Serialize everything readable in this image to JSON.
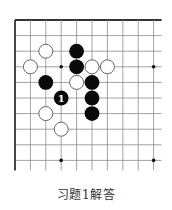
{
  "diagram": {
    "type": "go-board-diagram",
    "caption": "习题1解答",
    "grid": {
      "columns": 10,
      "rows": 10,
      "origin_x": 15,
      "origin_y": 20,
      "col_spacing": 15.4,
      "row_spacing": 15.6,
      "extend_right": 8,
      "extend_bottom": 10,
      "line_color": "#8a8a8a",
      "edge_color": "#333333"
    },
    "star_points": [
      {
        "col": 3,
        "row": 3
      },
      {
        "col": 9,
        "row": 3
      },
      {
        "col": 3,
        "row": 9
      },
      {
        "col": 9,
        "row": 9
      }
    ],
    "stones": [
      {
        "color": "black",
        "col": 4,
        "row": 2
      },
      {
        "color": "black",
        "col": 4,
        "row": 3
      },
      {
        "color": "black",
        "col": 2,
        "row": 4
      },
      {
        "color": "black",
        "col": 5,
        "row": 4
      },
      {
        "color": "black",
        "col": 3,
        "row": 5,
        "label": "1"
      },
      {
        "color": "black",
        "col": 5,
        "row": 5
      },
      {
        "color": "black",
        "col": 5,
        "row": 6
      },
      {
        "color": "white",
        "col": 2,
        "row": 2
      },
      {
        "color": "white",
        "col": 1,
        "row": 3
      },
      {
        "color": "white",
        "col": 5,
        "row": 3
      },
      {
        "color": "white",
        "col": 6,
        "row": 3
      },
      {
        "color": "white",
        "col": 4,
        "row": 4
      },
      {
        "color": "white",
        "col": 2,
        "row": 6
      },
      {
        "color": "white",
        "col": 3,
        "row": 7
      }
    ],
    "colors": {
      "black_stone": "#0a0a0a",
      "white_stone_fill": "#ffffff",
      "white_stone_stroke": "#555555",
      "label_on_black": "#ffffff"
    }
  }
}
